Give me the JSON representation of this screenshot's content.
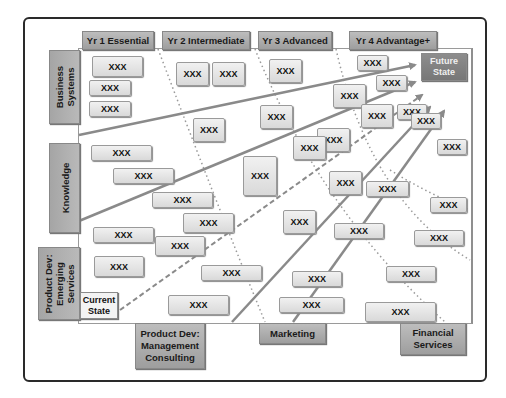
{
  "diagram": {
    "columns": [
      {
        "label": "Yr 1 Essential"
      },
      {
        "label": "Yr 2 Intermediate"
      },
      {
        "label": "Yr 3 Advanced"
      },
      {
        "label": "Yr 4 Advantage+"
      }
    ],
    "rows": [
      {
        "label": "Business\nSystems"
      },
      {
        "label": "Knowledge"
      },
      {
        "label": "Product Dev:\nEmerging\nServices"
      }
    ],
    "bottom_tabs": [
      {
        "label": "Product Dev:\nManagement\nConsulting"
      },
      {
        "label": "Marketing"
      },
      {
        "label": "Financial\nServices"
      }
    ],
    "future_state": "Future\nState",
    "current_state": "Current\nState",
    "boxes": [
      {
        "label": "XXX",
        "x": 92,
        "y": 56,
        "w": 51,
        "h": 21
      },
      {
        "label": "XXX",
        "x": 89,
        "y": 80,
        "w": 42,
        "h": 16
      },
      {
        "label": "XXX",
        "x": 89,
        "y": 101,
        "w": 42,
        "h": 16
      },
      {
        "label": "XXX",
        "x": 176,
        "y": 62,
        "w": 33,
        "h": 24
      },
      {
        "label": "XXX",
        "x": 212,
        "y": 62,
        "w": 33,
        "h": 24
      },
      {
        "label": "XXX",
        "x": 269,
        "y": 59,
        "w": 33,
        "h": 24
      },
      {
        "label": "XXX",
        "x": 357,
        "y": 55,
        "w": 31,
        "h": 16
      },
      {
        "label": "XXX",
        "x": 376,
        "y": 75,
        "w": 31,
        "h": 16
      },
      {
        "label": "XXX",
        "x": 333,
        "y": 84,
        "w": 33,
        "h": 24
      },
      {
        "label": "XXX",
        "x": 193,
        "y": 118,
        "w": 32,
        "h": 24
      },
      {
        "label": "XXX",
        "x": 260,
        "y": 105,
        "w": 33,
        "h": 24
      },
      {
        "label": "XXX",
        "x": 361,
        "y": 104,
        "w": 32,
        "h": 24
      },
      {
        "label": "XXX",
        "x": 397,
        "y": 104,
        "w": 30,
        "h": 16
      },
      {
        "label": "XXX",
        "x": 411,
        "y": 113,
        "w": 30,
        "h": 16
      },
      {
        "label": "XXX",
        "x": 91,
        "y": 145,
        "w": 61,
        "h": 16
      },
      {
        "label": "XXX",
        "x": 113,
        "y": 168,
        "w": 61,
        "h": 16
      },
      {
        "label": "XXX",
        "x": 317,
        "y": 128,
        "w": 33,
        "h": 24
      },
      {
        "label": "XXX",
        "x": 293,
        "y": 136,
        "w": 33,
        "h": 24
      },
      {
        "label": "XXX",
        "x": 437,
        "y": 139,
        "w": 30,
        "h": 16
      },
      {
        "label": "XXX",
        "x": 243,
        "y": 156,
        "w": 34,
        "h": 40
      },
      {
        "label": "XXX",
        "x": 152,
        "y": 192,
        "w": 61,
        "h": 16
      },
      {
        "label": "XXX",
        "x": 329,
        "y": 171,
        "w": 33,
        "h": 24
      },
      {
        "label": "XXX",
        "x": 366,
        "y": 181,
        "w": 43,
        "h": 16
      },
      {
        "label": "XXX",
        "x": 183,
        "y": 213,
        "w": 51,
        "h": 20
      },
      {
        "label": "XXX",
        "x": 430,
        "y": 197,
        "w": 37,
        "h": 16
      },
      {
        "label": "XXX",
        "x": 93,
        "y": 227,
        "w": 61,
        "h": 16
      },
      {
        "label": "XXX",
        "x": 155,
        "y": 236,
        "w": 50,
        "h": 20
      },
      {
        "label": "XXX",
        "x": 283,
        "y": 210,
        "w": 33,
        "h": 24
      },
      {
        "label": "XXX",
        "x": 334,
        "y": 223,
        "w": 50,
        "h": 16
      },
      {
        "label": "XXX",
        "x": 414,
        "y": 230,
        "w": 50,
        "h": 16
      },
      {
        "label": "XXX",
        "x": 94,
        "y": 256,
        "w": 50,
        "h": 21
      },
      {
        "label": "XXX",
        "x": 201,
        "y": 265,
        "w": 61,
        "h": 16
      },
      {
        "label": "XXX",
        "x": 292,
        "y": 271,
        "w": 50,
        "h": 16
      },
      {
        "label": "XXX",
        "x": 386,
        "y": 266,
        "w": 50,
        "h": 16
      },
      {
        "label": "XXX",
        "x": 168,
        "y": 295,
        "w": 61,
        "h": 20
      },
      {
        "label": "XXX",
        "x": 279,
        "y": 297,
        "w": 65,
        "h": 16
      },
      {
        "label": "XXX",
        "x": 365,
        "y": 302,
        "w": 71,
        "h": 20
      }
    ]
  }
}
